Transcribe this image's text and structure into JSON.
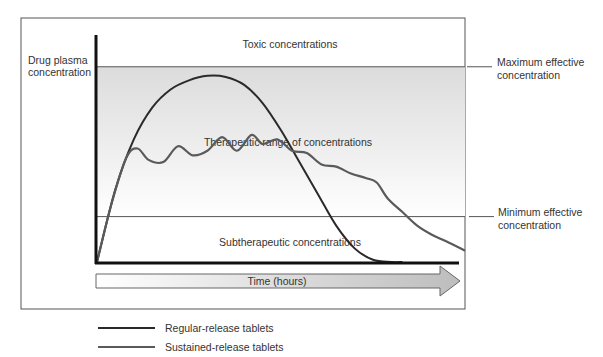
{
  "chart_data": {
    "type": "line",
    "title": "",
    "ylabel": "Drug plasma concentration",
    "xlabel": "Time (hours)",
    "ylim": [
      0,
      10
    ],
    "xlim": [
      0,
      10
    ],
    "zones": {
      "toxic": "Toxic concentrations",
      "therapeutic": "Therapeutic range of concentrations",
      "subtherapeutic": "Subtherapeutic concentrations"
    },
    "thresholds": [
      {
        "name": "Maximum effective concentration",
        "line1": "Maximum effective",
        "line2": "concentration",
        "y": 8.6
      },
      {
        "name": "Minimum effective concentration",
        "line1": "Minimum effective",
        "line2": "concentration",
        "y": 2.0
      }
    ],
    "series": [
      {
        "name": "Regular-release tablets",
        "color": "#2a2a2a",
        "x": [
          0,
          0.5,
          1,
          1.5,
          2,
          2.5,
          3,
          3.5,
          4,
          4.5,
          5,
          5.5,
          6,
          6.5,
          7,
          7.5,
          8,
          8.3
        ],
        "y": [
          0,
          3.2,
          5.4,
          6.8,
          7.6,
          8.0,
          8.2,
          8.15,
          7.8,
          7.0,
          5.8,
          4.4,
          3.0,
          1.6,
          0.6,
          0.1,
          0.0,
          0.0
        ]
      },
      {
        "name": "Sustained-release tablets",
        "color": "#5a5a5a",
        "x": [
          0,
          0.4,
          0.8,
          1.1,
          1.4,
          1.8,
          2.2,
          2.6,
          3.0,
          3.4,
          3.8,
          4.2,
          4.5,
          4.9,
          5.3,
          5.7,
          6.1,
          6.5,
          6.9,
          7.3,
          7.6,
          7.9,
          8.3,
          8.7,
          9.1,
          9.5,
          10.0
        ],
        "y": [
          0,
          2.6,
          4.6,
          5.0,
          4.5,
          4.4,
          5.1,
          4.7,
          4.9,
          5.5,
          4.9,
          5.6,
          5.2,
          5.4,
          4.9,
          4.8,
          4.3,
          4.2,
          3.9,
          3.7,
          3.5,
          2.8,
          2.2,
          1.6,
          1.2,
          0.9,
          0.5
        ]
      }
    ],
    "legend": {
      "position": "bottom-left",
      "entries": [
        "Regular-release tablets",
        "Sustained-release tablets"
      ]
    }
  }
}
